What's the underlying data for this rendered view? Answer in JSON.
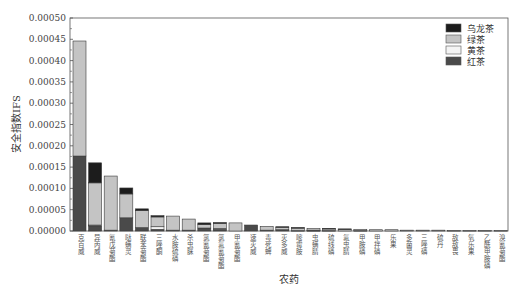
{
  "chart_data": {
    "type": "bar",
    "stacked": true,
    "title": "",
    "xlabel": "农药",
    "ylabel": "安全指数IFS",
    "ylim": [
      0,
      0.0005
    ],
    "yticks": [
      "0.00000",
      "0.00005",
      "0.00010",
      "0.00015",
      "0.00020",
      "0.00025",
      "0.00030",
      "0.00035",
      "0.00040",
      "0.00045",
      "0.00050"
    ],
    "legend_position": "upper right",
    "categories": [
      "克百威",
      "异丙威",
      "氰戊菊酯",
      "哒螨灵",
      "联苯菊酯",
      "三唑酮",
      "水胺硫磷",
      "杀虫脒",
      "氯氰菊酯",
      "氯氟氰菊酯",
      "甲氰菊酯",
      "速灭威",
      "毒死蜱",
      "灭多威",
      "嘧霉胺",
      "虫螨腈",
      "硫线磷",
      "氟虫腈",
      "甲胺磷",
      "甲拌磷",
      "乐果",
      "多菌灵",
      "三唑磷",
      "硫丹",
      "敌敌畏",
      "氧乐果",
      "乙酰甲胺磷",
      "溴氰菊酯"
    ],
    "series": [
      {
        "name": "红茶",
        "color": "#4a4a4a",
        "values": [
          0.000176,
          1.2e-05,
          2e-06,
          3.1e-05,
          8e-06,
          4e-06,
          2e-06,
          2e-06,
          7e-06,
          4e-06,
          0.0,
          1.4e-05,
          2e-06,
          3e-06,
          1e-06,
          1e-06,
          1e-06,
          0.0,
          1e-06,
          0.0,
          0.0,
          0.0,
          0.0,
          0.0,
          0.0,
          0.0,
          0.0,
          0.0
        ]
      },
      {
        "name": "黄茶",
        "color": "#f4f4f4",
        "values": [
          0.0,
          2e-06,
          0.0,
          0.0,
          0.0,
          6e-06,
          0.0,
          0.0,
          0.0,
          2e-06,
          0.0,
          0.0,
          0.0,
          0.0,
          0.0,
          1e-06,
          0.0,
          0.0,
          0.0,
          0.0,
          0.0,
          0.0,
          0.0,
          0.0,
          0.0,
          0.0,
          0.0,
          0.0
        ]
      },
      {
        "name": "绿茶",
        "color": "#c4c4c4",
        "values": [
          0.00027,
          9.9e-05,
          0.000127,
          5.6e-05,
          4e-05,
          2.3e-05,
          3.3e-05,
          2.6e-05,
          8e-06,
          1.2e-05,
          1.9e-05,
          0.0,
          9e-06,
          6e-06,
          6e-06,
          4e-06,
          4e-06,
          4e-06,
          3e-06,
          3e-06,
          3e-06,
          2e-06,
          2e-06,
          2e-06,
          1e-06,
          1e-06,
          1e-06,
          1e-06
        ]
      },
      {
        "name": "乌龙茶",
        "color": "#1c1c1c",
        "values": [
          0.0,
          4.7e-05,
          0.0,
          1.4e-05,
          4e-06,
          3e-06,
          0.0,
          0.0,
          4e-06,
          2e-06,
          0.0,
          0.0,
          0.0,
          1e-06,
          1e-06,
          0.0,
          1e-06,
          1e-06,
          0.0,
          0.0,
          0.0,
          0.0,
          0.0,
          0.0,
          0.0,
          0.0,
          0.0,
          0.0
        ]
      }
    ]
  },
  "legend": {
    "items": [
      {
        "label": "乌龙茶",
        "color": "#1c1c1c"
      },
      {
        "label": "绿茶",
        "color": "#c4c4c4"
      },
      {
        "label": "黄茶",
        "color": "#f4f4f4"
      },
      {
        "label": "红茶",
        "color": "#4a4a4a"
      }
    ]
  }
}
